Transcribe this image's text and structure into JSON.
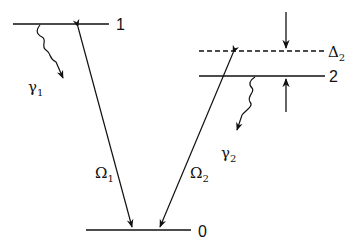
{
  "diagram": {
    "type": "energy-level-diagram (Lambda system)",
    "levels": [
      {
        "id": "level-1",
        "label": "1"
      },
      {
        "id": "level-2",
        "label": "2"
      },
      {
        "id": "level-0",
        "label": "0"
      },
      {
        "id": "virtual-level",
        "style": "dashed",
        "label": "Δ",
        "label_sub": "2"
      }
    ],
    "transitions": [
      {
        "id": "omega-1",
        "from": "1",
        "to": "0",
        "label": "Ω",
        "label_sub": "1"
      },
      {
        "id": "omega-2",
        "from": "virtual-level",
        "to": "0",
        "label": "Ω",
        "label_sub": "2"
      }
    ],
    "decays": [
      {
        "id": "gamma-1",
        "from": "1",
        "label": "γ",
        "label_sub": "1"
      },
      {
        "id": "gamma-2",
        "from": "2",
        "label": "γ",
        "label_sub": "2"
      }
    ],
    "colors": {
      "ink": "#111111",
      "background": "#ffffff"
    }
  }
}
